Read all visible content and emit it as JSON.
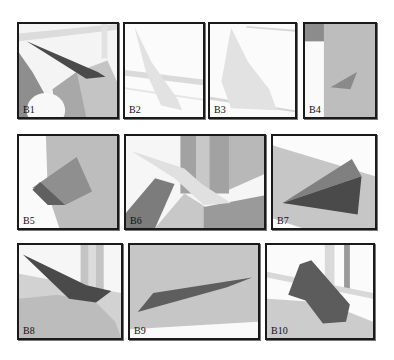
{
  "figure": {
    "panels": [
      {
        "id": "B1",
        "label": "B1"
      },
      {
        "id": "B2",
        "label": "B2"
      },
      {
        "id": "B3",
        "label": "B3"
      },
      {
        "id": "B4",
        "label": "B4"
      },
      {
        "id": "B5",
        "label": "B5"
      },
      {
        "id": "B6",
        "label": "B6"
      },
      {
        "id": "B7",
        "label": "B7"
      },
      {
        "id": "B8",
        "label": "B8"
      },
      {
        "id": "B9",
        "label": "B9"
      },
      {
        "id": "B10",
        "label": "B10"
      }
    ],
    "colors": {
      "border": "#1a1a1a",
      "background": "#ffffff",
      "shard_dark": "#505050",
      "shard_mid": "#8a8a8a",
      "shard_light": "#e4e4e4",
      "surface": "#c8c8c8"
    }
  }
}
